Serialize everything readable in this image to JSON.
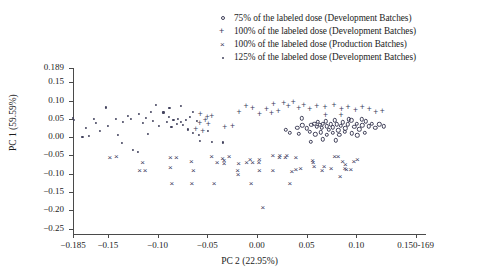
{
  "chart_data": {
    "type": "scatter",
    "title": "",
    "xlabel": "PC 2 (22.95%)",
    "ylabel": "PC 1 (59.59%)",
    "xlim": [
      -0.185,
      0.169
    ],
    "ylim": [
      -0.265,
      0.189
    ],
    "grid": false,
    "legend_position": "top-right",
    "xticks": [
      {
        "value": -0.185,
        "label": "−0.185"
      },
      {
        "value": -0.15,
        "label": "−0.15"
      },
      {
        "value": -0.1,
        "label": "−0.10"
      },
      {
        "value": -0.05,
        "label": "−0.05"
      },
      {
        "value": 0.0,
        "label": "0.00"
      },
      {
        "value": 0.05,
        "label": "0.05"
      },
      {
        "value": 0.1,
        "label": "0.10"
      },
      {
        "value": 0.1595,
        "label": "0.150-169"
      }
    ],
    "yticks": [
      {
        "value": 0.189,
        "label": "0.189"
      },
      {
        "value": 0.15,
        "label": "0.15"
      },
      {
        "value": 0.1,
        "label": "0.10"
      },
      {
        "value": 0.05,
        "label": "0.05"
      },
      {
        "value": 0.0,
        "label": "0.00"
      },
      {
        "value": -0.05,
        "label": "−0.05"
      },
      {
        "value": -0.1,
        "label": "−0.10"
      },
      {
        "value": -0.15,
        "label": "−0.15"
      },
      {
        "value": -0.2,
        "label": "−0.20"
      },
      {
        "value": -0.25,
        "label": "−0.25"
      }
    ],
    "series": [
      {
        "name": "75% of the labeled dose (Development Batches)",
        "marker": "circle",
        "points": [
          [
            0.0405,
            0.0255
          ],
          [
            0.0455,
            0.032
          ],
          [
            0.05,
            0.024
          ],
          [
            0.0545,
            0.033
          ],
          [
            0.0575,
            0.037
          ],
          [
            0.06,
            0.029
          ],
          [
            0.0615,
            0.0415
          ],
          [
            0.0635,
            0.033
          ],
          [
            0.065,
            0.025
          ],
          [
            0.0665,
            0.036
          ],
          [
            0.069,
            0.043
          ],
          [
            0.0705,
            0.0295
          ],
          [
            0.072,
            0.02
          ],
          [
            0.074,
            0.0355
          ],
          [
            0.0765,
            0.027
          ],
          [
            0.0785,
            0.0455
          ],
          [
            0.08,
            0.0345
          ],
          [
            0.082,
            0.0185
          ],
          [
            0.0845,
            0.0305
          ],
          [
            0.0865,
            0.04
          ],
          [
            0.089,
            0.024
          ],
          [
            0.0915,
            0.035
          ],
          [
            0.095,
            0.0455
          ],
          [
            0.098,
            0.0285
          ],
          [
            0.1005,
            0.037
          ],
          [
            0.103,
            0.0215
          ],
          [
            0.106,
            0.032
          ],
          [
            0.1095,
            0.043
          ],
          [
            0.1125,
            0.03
          ],
          [
            0.1155,
            0.0365
          ],
          [
            0.119,
            0.026
          ],
          [
            0.123,
            0.0345
          ],
          [
            0.1275,
            0.0295
          ],
          [
            0.029,
            0.0195
          ],
          [
            0.033,
            0.012
          ],
          [
            0.042,
            0.009
          ],
          [
            0.053,
            0.0145
          ],
          [
            0.0585,
            0.0075
          ],
          [
            0.064,
            0.013
          ],
          [
            0.07,
            0.006
          ],
          [
            0.076,
            0.0115
          ],
          [
            0.083,
            0.0065
          ],
          [
            0.0885,
            0.0145
          ],
          [
            0.0955,
            0.01
          ],
          [
            0.101,
            0.005
          ],
          [
            0.1085,
            0.0125
          ],
          [
            0.0665,
            -0.0055
          ],
          [
            0.079,
            -0.009
          ],
          [
            0.054,
            -0.013
          ],
          [
            0.0925,
            0.0485
          ],
          [
            0.1055,
            0.049
          ],
          [
            0.045,
            0.051
          ]
        ]
      },
      {
        "name": "100% of the labeled dose (Development Batches)",
        "marker": "plus",
        "points": [
          [
            -0.057,
            0.064
          ],
          [
            -0.05,
            0.056
          ],
          [
            -0.0455,
            0.0585
          ],
          [
            -0.052,
            0.047
          ],
          [
            -0.0575,
            0.0395
          ],
          [
            -0.049,
            0.0345
          ],
          [
            -0.0325,
            0.0285
          ],
          [
            -0.0245,
            0.03
          ],
          [
            -0.011,
            0.0855
          ],
          [
            -0.0045,
            0.0805
          ],
          [
            0.0165,
            0.0905
          ],
          [
            0.027,
            0.094
          ],
          [
            0.0315,
            0.0845
          ],
          [
            0.0365,
            0.096
          ],
          [
            0.042,
            0.08
          ],
          [
            0.047,
            0.087
          ],
          [
            0.0215,
            0.072
          ],
          [
            0.0095,
            0.076
          ],
          [
            0.053,
            0.076
          ],
          [
            0.06,
            0.0855
          ],
          [
            0.0685,
            0.0815
          ],
          [
            0.0775,
            0.088
          ],
          [
            0.085,
            0.077
          ],
          [
            0.0915,
            0.0835
          ],
          [
            0.099,
            0.0745
          ],
          [
            0.106,
            0.082
          ],
          [
            0.113,
            0.076
          ],
          [
            0.1195,
            0.0695
          ],
          [
            0.126,
            0.072
          ],
          [
            0.0025,
            0.062
          ],
          [
            0.0145,
            0.065
          ],
          [
            -0.018,
            0.07
          ],
          [
            0.069,
            0.0615
          ],
          [
            0.0845,
            0.0605
          ],
          [
            -0.0615,
            0.0215
          ],
          [
            -0.0545,
            0.016
          ]
        ]
      },
      {
        "name": "100% of the labeled dose (Production Batches)",
        "marker": "cross",
        "points": [
          [
            -0.1415,
            -0.0545
          ],
          [
            -0.115,
            -0.072
          ],
          [
            -0.118,
            -0.092
          ],
          [
            -0.1125,
            -0.093
          ],
          [
            -0.087,
            -0.0565
          ],
          [
            -0.081,
            -0.0565
          ],
          [
            -0.087,
            -0.0845
          ],
          [
            -0.066,
            -0.0675
          ],
          [
            -0.0855,
            -0.1295
          ],
          [
            -0.0655,
            -0.1295
          ],
          [
            -0.043,
            -0.129
          ],
          [
            -0.0455,
            -0.0555
          ],
          [
            -0.04,
            -0.071
          ],
          [
            -0.0345,
            -0.059
          ],
          [
            -0.033,
            -0.0655
          ],
          [
            -0.033,
            -0.073
          ],
          [
            -0.0185,
            -0.074
          ],
          [
            -0.0195,
            -0.094
          ],
          [
            -0.019,
            -0.104
          ],
          [
            -0.0105,
            -0.0705
          ],
          [
            -0.0045,
            -0.0705
          ],
          [
            -0.007,
            -0.0615
          ],
          [
            0.0025,
            -0.062
          ],
          [
            0.002,
            -0.071
          ],
          [
            0.0025,
            -0.093
          ],
          [
            -0.006,
            -0.1295
          ],
          [
            0.006,
            -0.194
          ],
          [
            0.016,
            -0.0525
          ],
          [
            0.0225,
            -0.056
          ],
          [
            0.023,
            -0.052
          ],
          [
            0.0285,
            -0.0565
          ],
          [
            0.03,
            -0.0525
          ],
          [
            0.039,
            -0.057
          ],
          [
            0.039,
            -0.091
          ],
          [
            0.035,
            -0.0945
          ],
          [
            0.056,
            -0.064
          ],
          [
            0.0565,
            -0.072
          ],
          [
            0.0575,
            -0.0805
          ],
          [
            0.0655,
            -0.094
          ],
          [
            0.0675,
            -0.083
          ],
          [
            0.0745,
            -0.0875
          ],
          [
            0.078,
            -0.0545
          ],
          [
            0.0815,
            -0.0545
          ],
          [
            0.086,
            -0.067
          ],
          [
            0.089,
            -0.076
          ],
          [
            0.0885,
            -0.086
          ],
          [
            0.09,
            -0.09
          ],
          [
            0.0945,
            -0.09
          ],
          [
            0.0975,
            -0.069
          ],
          [
            0.0835,
            -0.108
          ],
          [
            0.101,
            -0.062
          ],
          [
            -0.148,
            -0.056
          ],
          [
            -0.064,
            -0.093
          ],
          [
            -0.028,
            -0.0545
          ],
          [
            0.016,
            -0.094
          ],
          [
            0.033,
            -0.129
          ],
          [
            0.044,
            -0.087
          ]
        ]
      },
      {
        "name": "125% of the labeled dose (Development  Batches)",
        "marker": "dot",
        "points": [
          [
            -0.185,
            0.0535
          ],
          [
            -0.184,
            0.048
          ],
          [
            -0.172,
            0.025
          ],
          [
            -0.164,
            0.05
          ],
          [
            -0.162,
            0.039
          ],
          [
            -0.158,
            0.016
          ],
          [
            -0.152,
            0.081
          ],
          [
            -0.1495,
            0.0305
          ],
          [
            -0.142,
            0.0485
          ],
          [
            -0.14,
            0.0055
          ],
          [
            -0.135,
            0.0415
          ],
          [
            -0.1355,
            -0.016
          ],
          [
            -0.13,
            0.0585
          ],
          [
            -0.127,
            0.049
          ],
          [
            -0.125,
            -0.0345
          ],
          [
            -0.119,
            0.0645
          ],
          [
            -0.115,
            0.039
          ],
          [
            -0.1115,
            0.052
          ],
          [
            -0.107,
            0.07
          ],
          [
            -0.105,
            0.044
          ],
          [
            -0.1015,
            0.088
          ],
          [
            -0.0985,
            0.0315
          ],
          [
            -0.094,
            0.0675
          ],
          [
            -0.0905,
            0.0405
          ],
          [
            -0.0885,
            0.0545
          ],
          [
            -0.086,
            0.029
          ],
          [
            -0.084,
            0.046
          ],
          [
            -0.0805,
            0.035
          ],
          [
            -0.079,
            0.05
          ],
          [
            -0.0765,
            0.0415
          ],
          [
            -0.074,
            0.033
          ],
          [
            -0.0715,
            0.047
          ],
          [
            -0.069,
            0.021
          ],
          [
            -0.067,
            0.056
          ],
          [
            -0.064,
            0.068
          ],
          [
            -0.064,
            0.012
          ],
          [
            -0.0605,
            0.043
          ],
          [
            -0.076,
            0.0855
          ],
          [
            -0.088,
            0.079
          ],
          [
            -0.11,
            0.008
          ],
          [
            -0.058,
            0.0055
          ],
          [
            -0.049,
            0.018
          ],
          [
            -0.0575,
            -0.0095
          ],
          [
            -0.0455,
            -0.0135
          ],
          [
            -0.0345,
            -0.0145
          ],
          [
            -0.1195,
            -0.041
          ],
          [
            -0.169,
            0.0035
          ],
          [
            -0.1755,
            -0.0005
          ]
        ]
      }
    ]
  },
  "legend": {
    "entries": [
      {
        "marker": "circle",
        "label": "75% of the labeled dose (Development Batches)"
      },
      {
        "marker": "plus",
        "label": "100% of the labeled dose (Development Batches)"
      },
      {
        "marker": "cross",
        "label": "100% of the labeled dose (Production Batches)"
      },
      {
        "marker": "dot",
        "label": "125% of the labeled dose (Development  Batches)"
      }
    ]
  },
  "colors": {
    "marker": "#3a3a5c",
    "axis": "#4a4a4a",
    "text": "#1c1c1c",
    "background": "#ffffff"
  }
}
